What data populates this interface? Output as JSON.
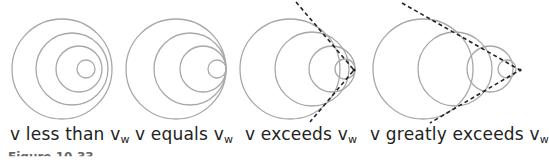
{
  "figure": {
    "caption_partial": "Figure 10.33",
    "circle_color": "#a8a8a8",
    "shock_line_color": "#222222",
    "panels": [
      {
        "id": "less",
        "label_prefix": "v less than v",
        "label_sub": "w",
        "circles": [
          {
            "cx": 62,
            "cy": 69,
            "r": 50
          },
          {
            "cx": 72,
            "cy": 69,
            "r": 36
          },
          {
            "cx": 79,
            "cy": 69,
            "r": 23
          },
          {
            "cx": 86,
            "cy": 69,
            "r": 9
          }
        ],
        "label_x": 10
      },
      {
        "id": "equals",
        "label_prefix": "v equals v",
        "label_sub": "w",
        "circles": [
          {
            "cx": 176,
            "cy": 69,
            "r": 50
          },
          {
            "cx": 190,
            "cy": 69,
            "r": 36
          },
          {
            "cx": 203,
            "cy": 69,
            "r": 23
          },
          {
            "cx": 217,
            "cy": 69,
            "r": 9
          }
        ],
        "label_x": 135
      },
      {
        "id": "exceeds",
        "label_prefix": "v exceeds v",
        "label_sub": "w",
        "circles": [
          {
            "cx": 290,
            "cy": 69,
            "r": 50
          },
          {
            "cx": 312,
            "cy": 69,
            "r": 37
          },
          {
            "cx": 332,
            "cy": 69,
            "r": 23
          },
          {
            "cx": 345,
            "cy": 69,
            "r": 10
          }
        ],
        "shock_cone": {
          "top": [
            296,
            2
          ],
          "apex": [
            354,
            70
          ],
          "bottom": [
            310,
            122
          ]
        },
        "label_x": 245
      },
      {
        "id": "greatly-exceeds",
        "label_prefix": "v greatly exceeds v",
        "label_sub": "w",
        "circles": [
          {
            "cx": 423,
            "cy": 69,
            "r": 50
          },
          {
            "cx": 455,
            "cy": 69,
            "r": 37
          },
          {
            "cx": 490,
            "cy": 69,
            "r": 23
          },
          {
            "cx": 507,
            "cy": 69,
            "r": 9
          }
        ],
        "shock_cone": {
          "top": [
            402,
            3
          ],
          "apex": [
            520,
            70
          ],
          "bottom": [
            430,
            123
          ]
        },
        "label_x": 370
      }
    ]
  }
}
